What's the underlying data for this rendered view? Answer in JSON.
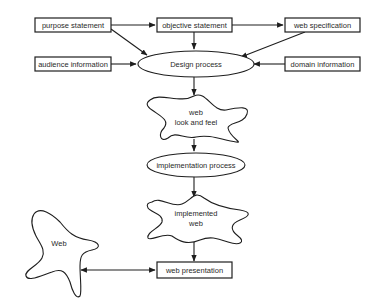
{
  "diagram": {
    "nodes": {
      "purpose": {
        "label": "purpose statement",
        "shape": "rect"
      },
      "objective": {
        "label": "objective statement",
        "shape": "rect"
      },
      "webspec": {
        "label": "web specification",
        "shape": "rect"
      },
      "audience": {
        "label": "audience information",
        "shape": "rect"
      },
      "design": {
        "label": "Design process",
        "shape": "ellipse"
      },
      "domain": {
        "label": "domain information",
        "shape": "rect"
      },
      "lookfeel": {
        "label_line1": "web",
        "label_line2": "look and feel",
        "shape": "blob"
      },
      "implproc": {
        "label": "implementation process",
        "shape": "ellipse"
      },
      "implweb": {
        "label_line1": "implemented",
        "label_line2": "web",
        "shape": "blob"
      },
      "presentation": {
        "label": "web presentation",
        "shape": "rect"
      },
      "web": {
        "label": "Web",
        "shape": "blob"
      }
    },
    "edges": [
      {
        "from": "purpose statement",
        "to": "objective statement"
      },
      {
        "from": "objective statement",
        "to": "web specification"
      },
      {
        "from": "purpose statement",
        "to": "Design process"
      },
      {
        "from": "objective statement",
        "to": "Design process"
      },
      {
        "from": "web specification",
        "to": "Design process"
      },
      {
        "from": "audience information",
        "to": "Design process"
      },
      {
        "from": "domain information",
        "to": "Design process"
      },
      {
        "from": "Design process",
        "to": "web look and feel"
      },
      {
        "from": "web look and feel",
        "to": "implementation process"
      },
      {
        "from": "implementation process",
        "to": "implemented web"
      },
      {
        "from": "implemented web",
        "to": "web presentation"
      },
      {
        "from": "Web",
        "to": "web presentation",
        "bidirectional": true
      }
    ],
    "colors": {
      "stroke": "#1e1e1e",
      "text": "#2a2a2a",
      "background": "#ffffff"
    }
  }
}
